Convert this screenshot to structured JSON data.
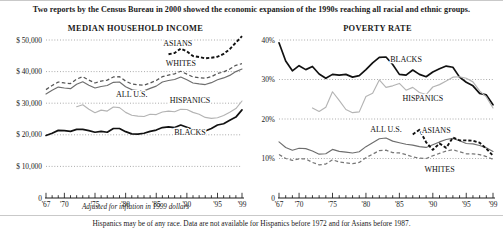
{
  "headline": "Two reports by the Census Bureau in 2000 showed the economic expansion of the 1990s reaching all racial and ethnic groups.",
  "panels": {
    "income_title": "MEDIAN HOUSEHOLD INCOME",
    "poverty_title": "POVERTY RATE"
  },
  "axis_note": "Adjusted for inflation in 1999 dollars",
  "footnote": "Hispanics may be of any race. Data are not available for Hispanics before 1972 and for Asians before 1987.",
  "colors": {
    "black": "#111111",
    "darkgray": "#6e6e6e",
    "lightgray": "#b4b4b4",
    "grid": "#8a8a8a",
    "text": "#1a1a1a"
  },
  "chart_data": [
    {
      "type": "line",
      "title": "MEDIAN HOUSEHOLD INCOME",
      "xlabel": "Adjusted for inflation in 1999 dollars",
      "ylabel": "",
      "xlim": [
        1967,
        1999
      ],
      "ylim": [
        0,
        50000
      ],
      "yticks": [
        0,
        10000,
        20000,
        30000,
        40000,
        50000
      ],
      "ytick_labels": [
        "0",
        "$ 10,000",
        "$ 20,000",
        "$ 30,000",
        "$ 40,000",
        "$ 50,000"
      ],
      "xticks": [
        1967,
        1970,
        1975,
        1980,
        1985,
        1990,
        1995,
        1999
      ],
      "xtick_labels": [
        "'67",
        "'70",
        "'75",
        "'80",
        "'85",
        "'90",
        "'95",
        "'99"
      ],
      "grid": true,
      "legend_position": "inline-labels",
      "series": [
        {
          "name": "ASIANS",
          "style": "dashed-heavy",
          "color": "#111111",
          "x": [
            1987,
            1988,
            1989,
            1990,
            1991,
            1992,
            1993,
            1994,
            1995,
            1996,
            1997,
            1998,
            1999
          ],
          "values": [
            45500,
            45900,
            47300,
            46400,
            44900,
            44600,
            44200,
            44400,
            44700,
            45600,
            47100,
            49200,
            51200
          ]
        },
        {
          "name": "WHITES",
          "style": "dashed",
          "color": "#555555",
          "x": [
            1967,
            1968,
            1969,
            1970,
            1971,
            1972,
            1973,
            1974,
            1975,
            1976,
            1977,
            1978,
            1979,
            1980,
            1981,
            1982,
            1983,
            1984,
            1985,
            1986,
            1987,
            1988,
            1989,
            1990,
            1991,
            1992,
            1993,
            1994,
            1995,
            1996,
            1997,
            1998,
            1999
          ],
          "values": [
            34300,
            35600,
            36700,
            36400,
            36200,
            37600,
            38400,
            37300,
            36400,
            37000,
            37300,
            38300,
            38400,
            37000,
            36100,
            35800,
            35700,
            36400,
            37200,
            38400,
            38900,
            39300,
            40100,
            39200,
            38300,
            38100,
            37900,
            38400,
            39400,
            39900,
            40800,
            42000,
            42500
          ]
        },
        {
          "name": "ALL U.S.",
          "style": "solid",
          "color": "#6e6e6e",
          "x": [
            1967,
            1968,
            1969,
            1970,
            1971,
            1972,
            1973,
            1974,
            1975,
            1976,
            1977,
            1978,
            1979,
            1980,
            1981,
            1982,
            1983,
            1984,
            1985,
            1986,
            1987,
            1988,
            1989,
            1990,
            1991,
            1992,
            1993,
            1994,
            1995,
            1996,
            1997,
            1998,
            1999
          ],
          "values": [
            32900,
            34100,
            35100,
            34800,
            34600,
            36000,
            36800,
            35700,
            34800,
            35300,
            35600,
            36600,
            36700,
            35200,
            34300,
            34000,
            33900,
            34700,
            35400,
            36700,
            37200,
            37500,
            38300,
            37400,
            36400,
            36100,
            35900,
            36500,
            37400,
            38000,
            38800,
            40000,
            40800
          ]
        },
        {
          "name": "HISPANICS",
          "style": "solid",
          "color": "#b4b4b4",
          "x": [
            1972,
            1973,
            1974,
            1975,
            1976,
            1977,
            1978,
            1979,
            1980,
            1981,
            1982,
            1983,
            1984,
            1985,
            1986,
            1987,
            1988,
            1989,
            1990,
            1991,
            1992,
            1993,
            1994,
            1995,
            1996,
            1997,
            1998,
            1999
          ],
          "values": [
            28900,
            29500,
            28100,
            27000,
            27800,
            27500,
            28800,
            28600,
            27100,
            26200,
            25900,
            25800,
            26500,
            26400,
            27200,
            27500,
            27300,
            28100,
            28000,
            27100,
            26500,
            25500,
            25200,
            25400,
            26100,
            27100,
            28300,
            30700
          ]
        },
        {
          "name": "BLACKS",
          "style": "solid-heavy",
          "color": "#111111",
          "x": [
            1967,
            1968,
            1969,
            1970,
            1971,
            1972,
            1973,
            1974,
            1975,
            1976,
            1977,
            1978,
            1979,
            1980,
            1981,
            1982,
            1983,
            1984,
            1985,
            1986,
            1987,
            1988,
            1989,
            1990,
            1991,
            1992,
            1993,
            1994,
            1995,
            1996,
            1997,
            1998,
            1999
          ],
          "values": [
            19800,
            20500,
            21400,
            21300,
            21100,
            21700,
            21700,
            21300,
            20800,
            21100,
            20800,
            22000,
            22000,
            21000,
            20300,
            20200,
            20500,
            21100,
            21500,
            22300,
            22500,
            22300,
            23100,
            22400,
            21700,
            21400,
            21200,
            22000,
            23100,
            23500,
            24600,
            25600,
            27900
          ]
        }
      ],
      "inline_labels": [
        {
          "text": "ASIANS",
          "x": 1988.5,
          "y": 48000
        },
        {
          "text": "WHITES",
          "x": 1989.0,
          "y": 41700
        },
        {
          "text": "ALL U.S.",
          "x": 1981.0,
          "y": 31900
        },
        {
          "text": "HISPANICS",
          "x": 1990.5,
          "y": 30200
        },
        {
          "text": "BLACKS",
          "x": 1990.5,
          "y": 19800
        }
      ]
    },
    {
      "type": "line",
      "title": "POVERTY RATE",
      "xlabel": "",
      "ylabel": "",
      "xlim": [
        1967,
        1999
      ],
      "ylim": [
        0,
        40
      ],
      "yticks": [
        0,
        10,
        20,
        30,
        40
      ],
      "ytick_labels": [
        "0",
        "10%",
        "20%",
        "30%",
        "40%"
      ],
      "xticks": [
        1967,
        1970,
        1975,
        1980,
        1985,
        1990,
        1995,
        1999
      ],
      "xtick_labels": [
        "'67",
        "'70",
        "'75",
        "'80",
        "'85",
        "'90",
        "'95",
        "'99"
      ],
      "grid": true,
      "legend_position": "inline-labels",
      "series": [
        {
          "name": "BLACKS",
          "style": "solid-heavy",
          "color": "#111111",
          "x": [
            1967,
            1968,
            1969,
            1970,
            1971,
            1972,
            1973,
            1974,
            1975,
            1976,
            1977,
            1978,
            1979,
            1980,
            1981,
            1982,
            1983,
            1984,
            1985,
            1986,
            1987,
            1988,
            1989,
            1990,
            1991,
            1992,
            1993,
            1994,
            1995,
            1996,
            1997,
            1998,
            1999
          ],
          "values": [
            39.3,
            34.7,
            32.2,
            33.5,
            32.5,
            33.3,
            31.4,
            30.3,
            31.3,
            31.1,
            31.3,
            30.6,
            31.0,
            32.5,
            34.2,
            35.6,
            35.7,
            33.8,
            31.3,
            31.1,
            32.4,
            31.3,
            30.7,
            31.9,
            32.7,
            33.4,
            33.1,
            30.6,
            29.3,
            28.4,
            26.5,
            26.1,
            23.6
          ]
        },
        {
          "name": "HISPANICS",
          "style": "solid",
          "color": "#b4b4b4",
          "x": [
            1972,
            1973,
            1974,
            1975,
            1976,
            1977,
            1978,
            1979,
            1980,
            1981,
            1982,
            1983,
            1984,
            1985,
            1986,
            1987,
            1988,
            1989,
            1990,
            1991,
            1992,
            1993,
            1994,
            1995,
            1996,
            1997,
            1998,
            1999
          ],
          "values": [
            22.8,
            21.9,
            23.0,
            26.9,
            24.7,
            22.4,
            21.6,
            21.8,
            25.7,
            26.5,
            29.9,
            28.0,
            28.4,
            29.0,
            27.3,
            28.0,
            26.7,
            26.2,
            28.1,
            28.7,
            29.6,
            30.6,
            30.7,
            30.3,
            29.4,
            27.1,
            25.6,
            22.8
          ]
        },
        {
          "name": "ALL U.S.",
          "style": "solid",
          "color": "#6e6e6e",
          "x": [
            1967,
            1968,
            1969,
            1970,
            1971,
            1972,
            1973,
            1974,
            1975,
            1976,
            1977,
            1978,
            1979,
            1980,
            1981,
            1982,
            1983,
            1984,
            1985,
            1986,
            1987,
            1988,
            1989,
            1990,
            1991,
            1992,
            1993,
            1994,
            1995,
            1996,
            1997,
            1998,
            1999
          ],
          "values": [
            14.2,
            12.8,
            12.1,
            12.6,
            12.5,
            11.9,
            11.1,
            11.2,
            12.3,
            11.8,
            11.6,
            11.4,
            11.7,
            13.0,
            14.0,
            15.0,
            15.2,
            14.4,
            14.0,
            13.6,
            13.4,
            13.0,
            12.8,
            13.5,
            14.2,
            14.8,
            15.1,
            14.5,
            13.8,
            13.7,
            13.3,
            12.7,
            11.8
          ]
        },
        {
          "name": "ASIANS",
          "style": "dashed-heavy",
          "color": "#111111",
          "x": [
            1987,
            1988,
            1989,
            1990,
            1991,
            1992,
            1993,
            1994,
            1995,
            1996,
            1997,
            1998,
            1999
          ],
          "values": [
            16.1,
            17.3,
            14.1,
            12.2,
            13.8,
            12.7,
            15.3,
            14.6,
            14.6,
            14.5,
            14.0,
            12.5,
            10.7
          ]
        },
        {
          "name": "WHITES",
          "style": "dashed",
          "color": "#777777",
          "x": [
            1967,
            1968,
            1969,
            1970,
            1971,
            1972,
            1973,
            1974,
            1975,
            1976,
            1977,
            1978,
            1979,
            1980,
            1981,
            1982,
            1983,
            1984,
            1985,
            1986,
            1987,
            1988,
            1989,
            1990,
            1991,
            1992,
            1993,
            1994,
            1995,
            1996,
            1997,
            1998,
            1999
          ],
          "values": [
            11.0,
            10.0,
            9.5,
            9.9,
            9.9,
            9.0,
            8.4,
            8.6,
            9.7,
            9.1,
            8.9,
            8.7,
            9.0,
            10.2,
            11.1,
            12.0,
            12.1,
            11.5,
            11.4,
            11.0,
            10.4,
            10.1,
            10.0,
            10.7,
            11.3,
            11.9,
            12.2,
            11.7,
            11.2,
            11.2,
            11.0,
            10.5,
            9.8
          ]
        }
      ],
      "inline_labels": [
        {
          "text": "BLACKS",
          "x": 1986.0,
          "y": 34.5
        },
        {
          "text": "HISPANICS",
          "x": 1988.5,
          "y": 24.6
        },
        {
          "text": "ALL U.S.",
          "x": 1983.0,
          "y": 16.7
        },
        {
          "text": "ASIANS",
          "x": 1990.5,
          "y": 16.4
        },
        {
          "text": "WHITES",
          "x": 1991.0,
          "y": 6.6
        }
      ]
    }
  ]
}
